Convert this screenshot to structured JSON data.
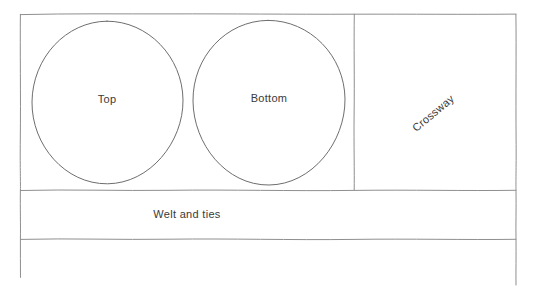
{
  "diagram": {
    "medium": "hand-drawn line sketch",
    "background_color": "#ffffff",
    "line_color": "#8f8f8f",
    "shape_line_color": "#6e6e6e",
    "text_color": "#3a3a3a"
  },
  "labels": {
    "top_piece": "Top",
    "bottom_piece": "Bottom",
    "crossway_panel": "Crossway",
    "welt_and_ties_strip": "Welt and ties"
  },
  "regions": {
    "upper_band": {
      "x": 20,
      "y": 14,
      "width": 496,
      "height": 176
    },
    "left_panel": {
      "x": 20,
      "y": 14,
      "width": 334,
      "height": 176
    },
    "crossway_panel": {
      "x": 354,
      "y": 14,
      "width": 162,
      "height": 176
    },
    "welt_strip": {
      "x": 20,
      "y": 190,
      "width": 496,
      "height": 49
    },
    "lower_open_band": {
      "x": 20,
      "y": 239,
      "width": 496,
      "height": 44
    }
  },
  "shapes": {
    "top_circle": {
      "cx": 107,
      "cy": 102,
      "rx": 76,
      "ry": 81
    },
    "bottom_circle": {
      "cx": 269,
      "cy": 102,
      "rx": 76,
      "ry": 82
    }
  },
  "crossway_label_rotation_deg": -40
}
